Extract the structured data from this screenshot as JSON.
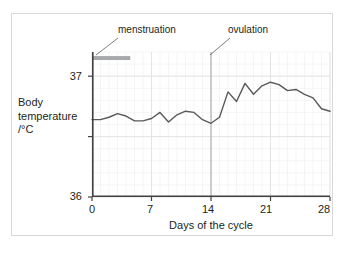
{
  "chart_data": {
    "type": "line",
    "title": "",
    "xlabel": "Days of the cycle",
    "ylabel": "Body temperature /°C",
    "ylabel_lines": [
      "Body",
      "temperature",
      "/°C"
    ],
    "xlim": [
      0,
      28
    ],
    "ylim": [
      36,
      37.2
    ],
    "xticks": [
      0,
      7,
      14,
      21,
      28
    ],
    "xtick_labels": [
      "0",
      "7",
      "14",
      "21",
      "28"
    ],
    "yticks": [
      36,
      36.5,
      37
    ],
    "ytick_labels": [
      "36",
      "",
      "37"
    ],
    "grid": true,
    "grid_minor": true,
    "legend": "none",
    "line_color": "#58595b",
    "series": [
      {
        "name": "Body temperature",
        "x": [
          0,
          1,
          2,
          3,
          4,
          5,
          6,
          7,
          8,
          9,
          10,
          11,
          12,
          13,
          14,
          15,
          16,
          17,
          18,
          19,
          20,
          21,
          22,
          23,
          24,
          25,
          26,
          27,
          28
        ],
        "values": [
          36.64,
          36.64,
          36.66,
          36.69,
          36.67,
          36.63,
          36.63,
          36.65,
          36.7,
          36.62,
          36.68,
          36.71,
          36.7,
          36.64,
          36.61,
          36.66,
          36.87,
          36.79,
          36.94,
          36.85,
          36.92,
          36.95,
          36.93,
          36.88,
          36.89,
          36.85,
          36.82,
          36.73,
          36.71
        ]
      }
    ],
    "annotations": [
      {
        "name": "menstruation",
        "label": "menstruation",
        "type": "bar",
        "x_start": 0,
        "x_end": 4.5,
        "y": 37.15,
        "color": "#a7a9ac"
      },
      {
        "name": "ovulation",
        "label": "ovulation",
        "type": "vline",
        "x": 14,
        "color": "#bcbec0"
      }
    ]
  },
  "chart": {
    "xlabel": "Days of the cycle",
    "ylabel_line1": "Body",
    "ylabel_line2": "temperature",
    "ylabel_line3": "/°C",
    "ytick_37": "37",
    "ytick_36": "36",
    "xtick_0": "0",
    "xtick_7": "7",
    "xtick_14": "14",
    "xtick_21": "21",
    "xtick_28": "28",
    "annotation_menstruation": "menstruation",
    "annotation_ovulation": "ovulation"
  }
}
